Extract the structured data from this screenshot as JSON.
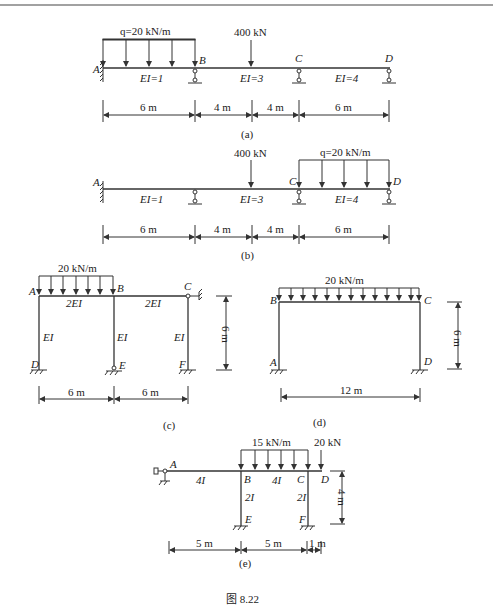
{
  "figure_caption": "图 8.22",
  "panels": {
    "a": {
      "label": "(a)",
      "nodes": [
        "A",
        "B",
        "C",
        "D"
      ],
      "load_q": "q=20 kN/m",
      "load_p": "400 kN",
      "ei": [
        "EI=1",
        "EI=3",
        "EI=4"
      ],
      "dims": [
        "6 m",
        "4 m",
        "4 m",
        "6 m"
      ]
    },
    "b": {
      "label": "(b)",
      "nodes": [
        "A",
        "C",
        "D"
      ],
      "load_q": "q=20 kN/m",
      "load_p": "400 kN",
      "ei": [
        "EI=1",
        "EI=3",
        "EI=4"
      ],
      "dims": [
        "6 m",
        "4 m",
        "4 m",
        "6 m"
      ]
    },
    "c": {
      "label": "(c)",
      "nodes": [
        "A",
        "B",
        "C",
        "D",
        "E",
        "F"
      ],
      "load_q": "20 kN/m",
      "beam_ei": [
        "2EI",
        "2EI"
      ],
      "col_ei": [
        "EI",
        "EI",
        "EI"
      ],
      "dims": [
        "6 m",
        "6 m"
      ],
      "height": "6 m"
    },
    "d": {
      "label": "(d)",
      "nodes": [
        "A",
        "B",
        "C",
        "D"
      ],
      "load_q": "20 kN/m",
      "span": "12 m",
      "height": "6 m"
    },
    "e": {
      "label": "(e)",
      "nodes": [
        "A",
        "B",
        "C",
        "D",
        "E",
        "F"
      ],
      "load_q": "15 kN/m",
      "load_p": "20 kN",
      "beam_i": [
        "4I",
        "4I"
      ],
      "col_i": [
        "2I",
        "2I"
      ],
      "dims": [
        "5 m",
        "5 m",
        "1 m"
      ],
      "height": "4 m"
    }
  }
}
